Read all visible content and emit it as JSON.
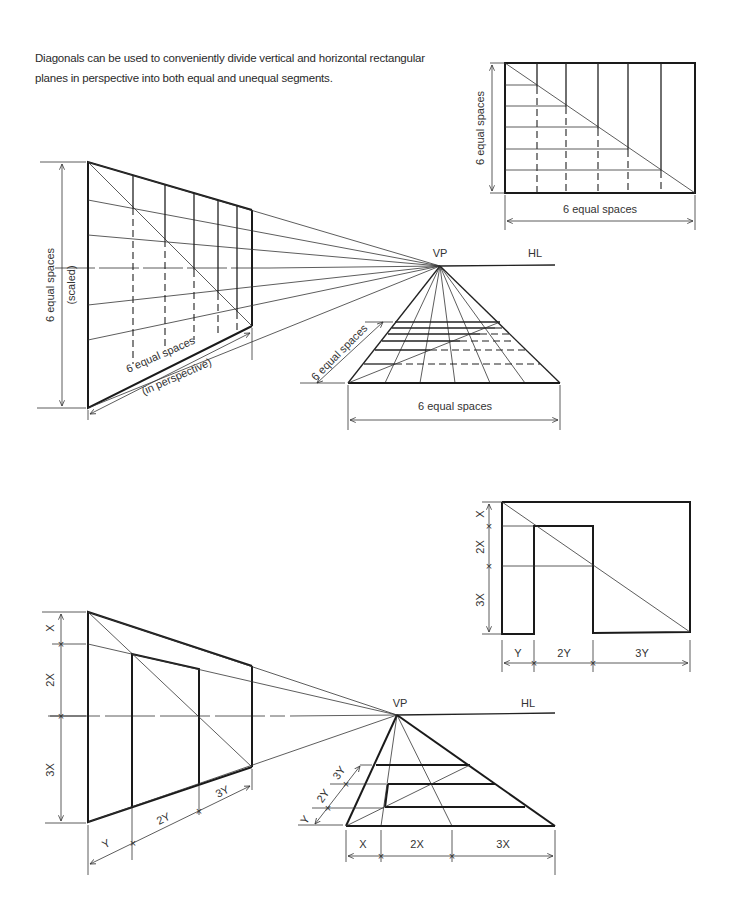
{
  "caption": "Diagonals can be used to conveniently divide vertical and horizontal rectangular planes in perspective into both equal and unequal segments.",
  "labels": {
    "vp": "VP",
    "hl": "HL",
    "six_equal_spaces": "6 equal spaces",
    "scaled": "(scaled)",
    "in_perspective": "(in perspective)",
    "x": "X",
    "two_x": "2X",
    "three_x": "3X",
    "y": "Y",
    "two_y": "2Y",
    "three_y": "3Y"
  },
  "figures": [
    {
      "id": "equal-elevation",
      "description": "Rectangle divided into 6 equal spaces via diagonal",
      "dimensions": [
        "6 equal spaces",
        "6 equal spaces"
      ]
    },
    {
      "id": "equal-vertical-perspective",
      "description": "Vertical plane in one-point perspective divided into 6 equal spaces",
      "dimensions": [
        "6 equal spaces (scaled)",
        "6 equal spaces (in perspective)"
      ]
    },
    {
      "id": "equal-horizontal-perspective",
      "description": "Horizontal plane in perspective divided into 6 equal spaces",
      "dimensions": [
        "6 equal spaces",
        "6 equal spaces"
      ]
    },
    {
      "id": "unequal-elevation",
      "description": "Rectangle divided into unequal segments",
      "dimensions": [
        "X",
        "2X",
        "3X",
        "Y",
        "2Y",
        "3Y"
      ]
    },
    {
      "id": "unequal-vertical-perspective",
      "description": "Vertical plane in perspective divided X/2X/3X and Y/2Y/3Y",
      "dimensions": [
        "X",
        "2X",
        "3X",
        "Y",
        "2Y",
        "3Y"
      ]
    },
    {
      "id": "unequal-horizontal-perspective",
      "description": "Horizontal plane in perspective divided X/2X/3X and Y/2Y/3Y",
      "dimensions": [
        "X",
        "2X",
        "3X",
        "Y",
        "2Y",
        "3Y"
      ]
    }
  ]
}
